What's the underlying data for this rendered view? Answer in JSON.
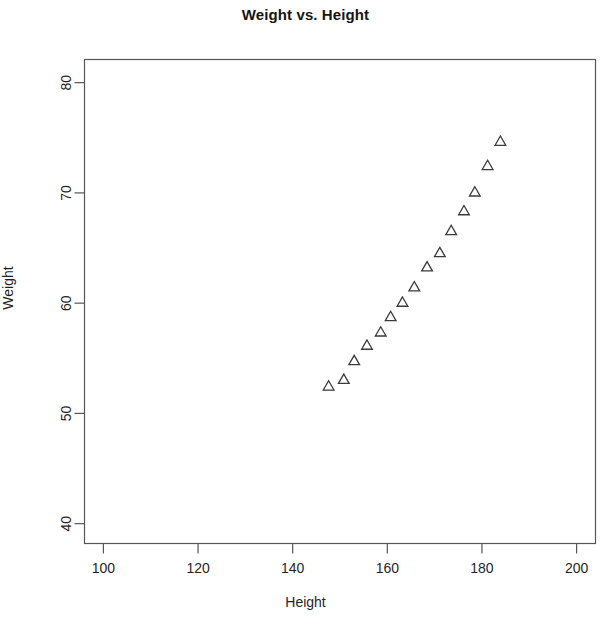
{
  "chart_data": {
    "type": "scatter",
    "title": "Weight vs. Height",
    "xlabel": "Height",
    "ylabel": "Weight",
    "xlim": [
      96,
      204
    ],
    "ylim": [
      38.2,
      82.1
    ],
    "xticks": [
      100,
      120,
      140,
      160,
      180,
      200
    ],
    "yticks": [
      40,
      50,
      60,
      70,
      80
    ],
    "grid": false,
    "legend": null,
    "marker": "open-triangle",
    "marker_color": "#3a3a3a",
    "series": [
      {
        "name": "observations",
        "x": [
          147.6,
          150.8,
          153.0,
          155.7,
          158.6,
          160.7,
          163.2,
          165.7,
          168.4,
          171.1,
          173.5,
          176.2,
          178.5,
          181.2,
          183.9
        ],
        "y": [
          52.4,
          53.0,
          54.7,
          56.1,
          57.3,
          58.7,
          60.0,
          61.4,
          63.2,
          64.5,
          66.5,
          68.3,
          70.0,
          72.4,
          74.6
        ]
      }
    ]
  },
  "axis": {
    "y_tick_labels": [
      "40",
      "50",
      "60",
      "70",
      "80"
    ],
    "x_tick_labels": [
      "100",
      "120",
      "140",
      "160",
      "180",
      "200"
    ]
  }
}
